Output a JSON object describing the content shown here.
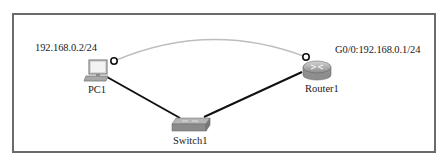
{
  "diagram": {
    "type": "network-topology",
    "colors": {
      "frame_border": "#6a6a6a",
      "ethernet_link": "#111111",
      "wan_arc": "#bdbdbd",
      "link_indicator": "#111111",
      "device_gray": "#9a9a9a"
    },
    "nodes": [
      {
        "id": "pc1",
        "label": "PC1",
        "icon": "pc-icon",
        "address": "192.168.0.2/24"
      },
      {
        "id": "router1",
        "label": "Router1",
        "icon": "router-icon",
        "address": "G0/0:192.168.0.1/24"
      },
      {
        "id": "switch1",
        "label": "Switch1",
        "icon": "switch-icon"
      }
    ],
    "links": [
      {
        "from": "PC1",
        "to": "Switch1",
        "style": "solid-black"
      },
      {
        "from": "Router1",
        "to": "Switch1",
        "style": "solid-black"
      },
      {
        "from": "PC1",
        "to": "Router1",
        "style": "gray-arc"
      }
    ]
  }
}
